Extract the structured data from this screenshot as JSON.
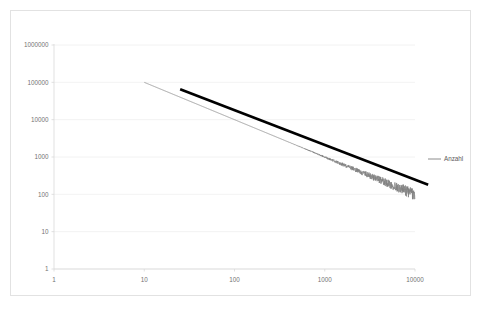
{
  "chart": {
    "title": "",
    "plot_background": "#ffffff",
    "frame_border_color": "#e2e2e2",
    "gridline_color": "#efefef",
    "axis_color": "#d9d9d9"
  },
  "legend": {
    "position": "right",
    "entries": [
      {
        "label": "Anzahl",
        "color": "#808080"
      }
    ]
  },
  "xaxis": {
    "label": "",
    "scale": "log",
    "tick_labels": [
      "1",
      "10",
      "100",
      "1000",
      "10000"
    ],
    "tick_values": [
      1,
      10,
      100,
      1000,
      10000
    ],
    "min": 1,
    "max": 10000
  },
  "yaxis": {
    "label": "",
    "scale": "log",
    "tick_labels": [
      "1",
      "10",
      "100",
      "1000",
      "10000",
      "100000",
      "1000000"
    ],
    "tick_values": [
      1,
      10,
      100,
      1000,
      10000,
      100000,
      1000000
    ],
    "min": 1,
    "max": 1000000
  },
  "chart_data": {
    "type": "line",
    "title": "",
    "xlabel": "",
    "ylabel": "",
    "xscale": "log",
    "yscale": "log",
    "xlim": [
      1,
      10000
    ],
    "ylim": [
      1,
      1000000
    ],
    "grid": "horizontal-only",
    "legend_position": "right",
    "series": [
      {
        "name": "Anzahl",
        "type": "line",
        "color": "#808080",
        "width": 0.75,
        "description": "Empirical rank-frequency (Zipf) curve, noisy at the high-rank tail",
        "model": {
          "kind": "power-law-with-noise",
          "intercept_at_x1": 1000000,
          "exponent": -1.0,
          "noise_onset_x": 300,
          "noise_max_log_amplitude": 0.16
        },
        "x": [
          10,
          14,
          20,
          28,
          40,
          56,
          80,
          110,
          160,
          220,
          320,
          450,
          630,
          900,
          1300,
          1800,
          2500,
          3500,
          5000,
          7000,
          10000
        ],
        "y": [
          100000,
          71000,
          50000,
          35700,
          25000,
          17900,
          12500,
          9090,
          6250,
          4550,
          3120,
          2220,
          1590,
          1110,
          769,
          556,
          400,
          286,
          200,
          143,
          125
        ]
      },
      {
        "name": "Trendlinie",
        "type": "trendline",
        "color": "#000000",
        "width": 2.6,
        "description": "Thick black power-law fit line extending past the data range",
        "model": {
          "kind": "power-law",
          "exponent": -0.93
        },
        "x": [
          25,
          14000
        ],
        "y": [
          65000,
          180
        ]
      }
    ]
  }
}
